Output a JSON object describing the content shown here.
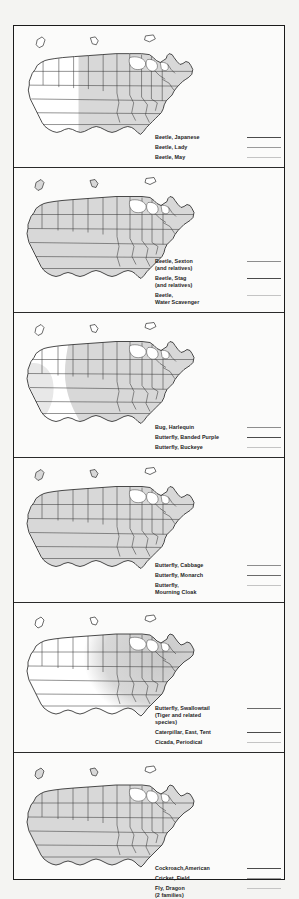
{
  "document": {
    "type": "insect-range-maps",
    "region": "United States",
    "panel_count": 6,
    "entries_per_panel": 3,
    "border_color": "#1b1b1b",
    "page_background": "#fbfbfa",
    "outer_background": "#f4f4f2"
  },
  "shading": {
    "dark": "#c9c9c9",
    "mid": "#d8d8d8",
    "light": "#e8e8e8",
    "unshaded": "#ffffff",
    "outline": "#3a3a3a"
  },
  "panels": [
    {
      "id": "panel-1",
      "range_style": "eastern-two-thirds",
      "legend": [
        {
          "label": "Beetle, Japanese",
          "swatch_color": "#4a4a4a"
        },
        {
          "label": "Beetle, Lady",
          "swatch_color": "#9a9a9a"
        },
        {
          "label": "Beetle, May",
          "swatch_color": "#c4c4c4"
        }
      ]
    },
    {
      "id": "panel-2",
      "range_style": "nationwide",
      "legend": [
        {
          "label": "Beetle, Sexton\n   (and relatives)",
          "swatch_color": "#8d8d8d"
        },
        {
          "label": "Beetle, Stag\n   (and relatives)",
          "swatch_color": "#4a4a4a"
        },
        {
          "label": "Beetle,\n   Water Scavenger",
          "swatch_color": "#c4c4c4"
        }
      ]
    },
    {
      "id": "panel-3",
      "range_style": "eastern-curved",
      "legend": [
        {
          "label": "Bug, Harlequin",
          "swatch_color": "#8d8d8d"
        },
        {
          "label": "Butterfly, Banded Purple",
          "swatch_color": "#4a4a4a"
        },
        {
          "label": "Butterfly, Buckeye",
          "swatch_color": "#c4c4c4"
        }
      ]
    },
    {
      "id": "panel-4",
      "range_style": "nationwide",
      "legend": [
        {
          "label": "Butterfly, Cabbage",
          "swatch_color": "#8d8d8d"
        },
        {
          "label": "Butterfly, Monarch",
          "swatch_color": "#6a6a6a"
        },
        {
          "label": "Butterfly,\n   Mourning Cloak",
          "swatch_color": "#c4c4c4"
        }
      ]
    },
    {
      "id": "panel-5",
      "range_style": "eastern-blob",
      "legend": [
        {
          "label": "Butterfly, Swallowtail\n   (Tiger and related\n      species)",
          "swatch_color": "#6a6a6a"
        },
        {
          "label": "Caterpillar, East, Tent",
          "swatch_color": "#4a4a4a"
        },
        {
          "label": "Cicada, Periodical",
          "swatch_color": "#c4c4c4"
        }
      ]
    },
    {
      "id": "panel-6",
      "range_style": "nationwide",
      "legend": [
        {
          "label": "Cockroach,American",
          "swatch_color": "#4a4a4a"
        },
        {
          "label": "Cricket, Field",
          "swatch_color": "#9a9a9a"
        },
        {
          "label": "Fly, Dragon\n   (2 families)",
          "swatch_color": "#c4c4c4"
        }
      ]
    }
  ]
}
